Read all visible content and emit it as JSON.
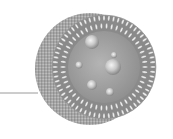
{
  "diagram": {
    "style": "grayscale 3D illustration",
    "leader_line": {
      "x1": 0,
      "y1": 93,
      "x2": 38,
      "y2": 93,
      "color": "#9a9a9a"
    },
    "shell_back": {
      "cx": 90,
      "cy": 69,
      "rx": 55,
      "ry": 56,
      "color": "#a8a8a8"
    },
    "bilayer_ring": {
      "cx": 104,
      "cy": 67,
      "r_outer": 52,
      "r_inner": 37,
      "head_color": "#efefef",
      "tail_color": "#8a8a8a"
    },
    "core": {
      "cx": 104,
      "cy": 67,
      "r": 36,
      "color": "#9c9c9c"
    },
    "inner_spheres": [
      {
        "cx": 92,
        "cy": 42,
        "r": 7
      },
      {
        "cx": 79,
        "cy": 65,
        "r": 3.5
      },
      {
        "cx": 114,
        "cy": 55,
        "r": 3
      },
      {
        "cx": 113,
        "cy": 67,
        "r": 8
      },
      {
        "cx": 92,
        "cy": 85,
        "r": 5
      },
      {
        "cx": 110,
        "cy": 92,
        "r": 4
      }
    ]
  }
}
